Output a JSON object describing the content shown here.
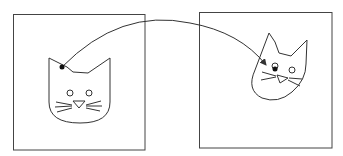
{
  "diagram": {
    "stroke_color": "#333333",
    "background": "#ffffff",
    "panels": [
      {
        "name": "left-frame",
        "x": 13,
        "y": 14,
        "w": 132,
        "h": 136
      },
      {
        "name": "right-frame",
        "x": 199,
        "y": 12,
        "w": 133,
        "h": 136
      }
    ],
    "keypoints": [
      {
        "name": "left-keypoint",
        "x": 62,
        "y": 67
      },
      {
        "name": "right-keypoint-arrow-tip",
        "x": 267,
        "y": 66
      },
      {
        "name": "right-keypoint",
        "x": 275,
        "y": 69
      }
    ],
    "arrow": {
      "from": [
        62,
        67
      ],
      "to": [
        266,
        65
      ]
    }
  }
}
